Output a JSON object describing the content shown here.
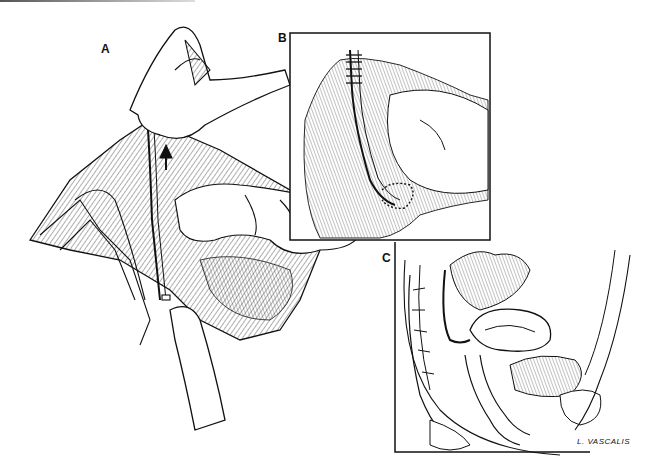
{
  "figure": {
    "type": "medical line illustration",
    "panels": [
      {
        "label": "A",
        "description": "Surgical field with retracted bowel; fingers lifting a tubular structure with an arrow indicating upward traction"
      },
      {
        "label": "B",
        "description": "Inset box showing sutured tubular structure with stitches at top and anastomosis at bottom"
      },
      {
        "label": "C",
        "description": "Inset box showing sagittal pelvic section with sacrum, uterus, bladder and a tube passing along the posterior pelvis"
      }
    ],
    "signature": "L. VASCALIS"
  },
  "colors": {
    "ink": "#111111",
    "background": "#ffffff",
    "hatching": "#444444"
  }
}
